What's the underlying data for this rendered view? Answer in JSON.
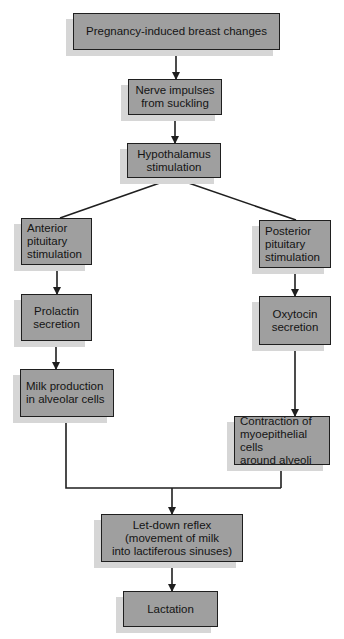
{
  "diagram": {
    "type": "flowchart",
    "colors": {
      "box_fill": "#9f9f9f",
      "box_border": "#1f1f1f",
      "shadow": "#d6d6d6",
      "line": "#1f1f1f",
      "background": "#ffffff"
    },
    "nodes": [
      {
        "id": "pregnancy",
        "label": "Pregnancy-induced breast changes",
        "x": 73,
        "y": 13,
        "w": 207,
        "h": 37,
        "align": "center"
      },
      {
        "id": "nerve",
        "label": "Nerve impulses\nfrom suckling",
        "x": 128,
        "y": 79,
        "w": 94,
        "h": 36,
        "align": "center"
      },
      {
        "id": "hypothalamus",
        "label": "Hypothalamus\nstimulation",
        "x": 127,
        "y": 143,
        "w": 94,
        "h": 35,
        "align": "center"
      },
      {
        "id": "anterior",
        "label": "Anterior\npituitary\nstimulation",
        "x": 21,
        "y": 218,
        "w": 71,
        "h": 47,
        "align": "left"
      },
      {
        "id": "posterior",
        "label": "Posterior\npituitary\nstimulation",
        "x": 259,
        "y": 220,
        "w": 72,
        "h": 48,
        "align": "left"
      },
      {
        "id": "prolactin",
        "label": "Prolactin\nsecretion",
        "x": 21,
        "y": 294,
        "w": 71,
        "h": 47,
        "align": "center"
      },
      {
        "id": "oxytocin",
        "label": "Oxytocin\nsecretion",
        "x": 259,
        "y": 296,
        "w": 72,
        "h": 49,
        "align": "center"
      },
      {
        "id": "milk",
        "label": "Milk production\nin alveolar cells",
        "x": 20,
        "y": 369,
        "w": 94,
        "h": 48,
        "align": "left"
      },
      {
        "id": "contraction",
        "label": "Contraction of\nmyoepithelial cells\naround alveoli",
        "x": 234,
        "y": 416,
        "w": 96,
        "h": 49,
        "align": "left"
      },
      {
        "id": "letdown",
        "label": "Let-down reflex\n(movement of milk\ninto lactiferous sinuses)",
        "x": 101,
        "y": 514,
        "w": 142,
        "h": 48,
        "align": "center"
      },
      {
        "id": "lactation",
        "label": "Lactation",
        "x": 123,
        "y": 591,
        "w": 95,
        "h": 36,
        "align": "center"
      }
    ],
    "edges": [
      {
        "from": "pregnancy",
        "to": "nerve",
        "points": [
          [
            176,
            50
          ],
          [
            176,
            79
          ]
        ],
        "arrow": true
      },
      {
        "from": "nerve",
        "to": "hypothalamus",
        "points": [
          [
            175,
            115
          ],
          [
            175,
            143
          ]
        ],
        "arrow": true
      },
      {
        "from": "hypothalamus",
        "to": "anterior",
        "points": [
          [
            174,
            178
          ],
          [
            60,
            218
          ]
        ],
        "arrow": false
      },
      {
        "from": "hypothalamus",
        "to": "posterior",
        "points": [
          [
            174,
            178
          ],
          [
            296,
            220
          ]
        ],
        "arrow": false
      },
      {
        "from": "anterior",
        "to": "prolactin",
        "points": [
          [
            57,
            265
          ],
          [
            57,
            294
          ]
        ],
        "arrow": true
      },
      {
        "from": "posterior",
        "to": "oxytocin",
        "points": [
          [
            295,
            268
          ],
          [
            295,
            296
          ]
        ],
        "arrow": true
      },
      {
        "from": "prolactin",
        "to": "milk",
        "points": [
          [
            56,
            341
          ],
          [
            56,
            369
          ]
        ],
        "arrow": true
      },
      {
        "from": "oxytocin",
        "to": "contraction",
        "points": [
          [
            295,
            345
          ],
          [
            295,
            416
          ]
        ],
        "arrow": true
      },
      {
        "from": "milk",
        "to": "junction",
        "points": [
          [
            66,
            417
          ],
          [
            66,
            488
          ],
          [
            281,
            488
          ]
        ],
        "arrow": false
      },
      {
        "from": "contraction",
        "to": "junction",
        "points": [
          [
            281,
            465
          ],
          [
            281,
            488
          ]
        ],
        "arrow": false
      },
      {
        "from": "junction",
        "to": "letdown",
        "points": [
          [
            172,
            488
          ],
          [
            172,
            514
          ]
        ],
        "arrow": true
      },
      {
        "from": "letdown",
        "to": "lactation",
        "points": [
          [
            172,
            562
          ],
          [
            172,
            591
          ]
        ],
        "arrow": true
      }
    ],
    "shadow_offset": {
      "dx": -7,
      "dy": 6
    }
  }
}
